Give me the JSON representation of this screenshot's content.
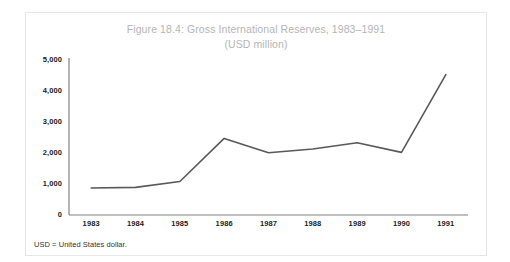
{
  "figure": {
    "title": "Figure 18.4: Gross International Reserves, 1983–1991",
    "subtitle": "(USD million)",
    "footnote": "USD = United States dollar."
  },
  "colors": {
    "title_text": "#b5b5b5",
    "axis_text": "#222222",
    "line": "#595959",
    "axis_line": "#808080",
    "frame_border": "#e6e6e6",
    "background": "#ffffff"
  },
  "chart_data": {
    "type": "line",
    "title": "Figure 18.4: Gross International Reserves, 1983–1991",
    "subtitle": "(USD million)",
    "xlabel": "",
    "ylabel": "",
    "categories": [
      "1983",
      "1984",
      "1985",
      "1986",
      "1987",
      "1988",
      "1989",
      "1990",
      "1991"
    ],
    "values": [
      870,
      890,
      1080,
      2470,
      2010,
      2130,
      2330,
      2020,
      4530
    ],
    "series": [
      {
        "name": "Gross International Reserves",
        "values": [
          870,
          890,
          1080,
          2470,
          2010,
          2130,
          2330,
          2020,
          4530
        ]
      }
    ],
    "ylim": [
      0,
      5000
    ],
    "ytick_labels": [
      "0",
      "1,000",
      "2,000",
      "3,000",
      "4,000",
      "5,000"
    ],
    "ytick_values": [
      0,
      1000,
      2000,
      3000,
      4000,
      5000
    ],
    "xtick_labels": [
      "1983",
      "1984",
      "1985",
      "1986",
      "1987",
      "1988",
      "1989",
      "1990",
      "1991"
    ],
    "grid": false,
    "legend": false,
    "legend_position": "none",
    "line_color": "#595959",
    "line_width": 1.6,
    "markers": false
  }
}
